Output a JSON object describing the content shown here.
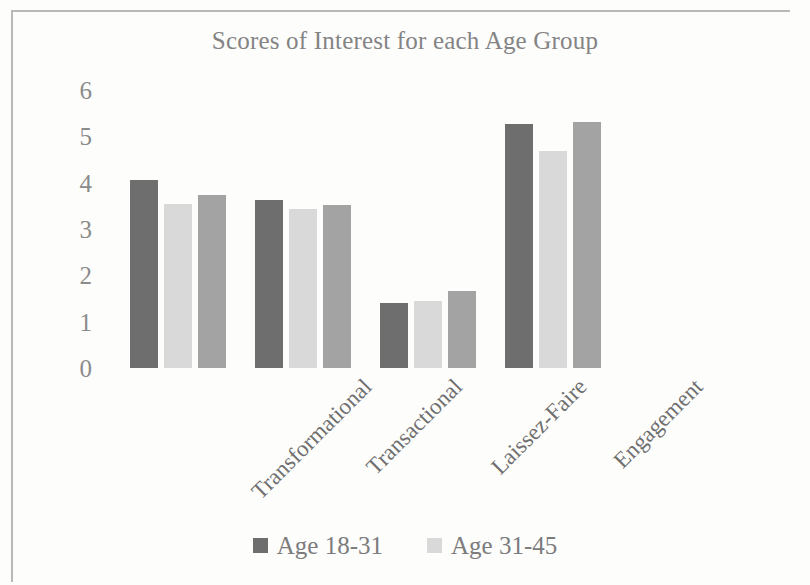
{
  "chart_data": {
    "type": "bar",
    "title": "Scores of Interest for each Age Group",
    "xlabel": "",
    "ylabel": "",
    "ylim": [
      0,
      6
    ],
    "ytick_step": 1,
    "yticks": [
      "6",
      "5",
      "4",
      "3",
      "2",
      "1",
      "0"
    ],
    "grid": false,
    "legend_position": "bottom",
    "categories": [
      "Transformational",
      "Transactional",
      "Laissez-Faire",
      "Engagement"
    ],
    "series": [
      {
        "name": "Age 18-31",
        "color": "#6e6e6e",
        "values": [
          4.05,
          3.63,
          1.4,
          5.27
        ]
      },
      {
        "name": "Age 31-45",
        "color": "#d9d9d9",
        "values": [
          3.55,
          3.43,
          1.45,
          4.68
        ]
      },
      {
        "name": "",
        "color": "#a3a3a3",
        "values": [
          3.73,
          3.52,
          1.67,
          5.3
        ]
      }
    ]
  },
  "legend": {
    "entries": [
      {
        "label": "Age 18-31",
        "color": "#6e6e6e"
      },
      {
        "label": "Age 31-45",
        "color": "#d9d9d9"
      }
    ]
  }
}
